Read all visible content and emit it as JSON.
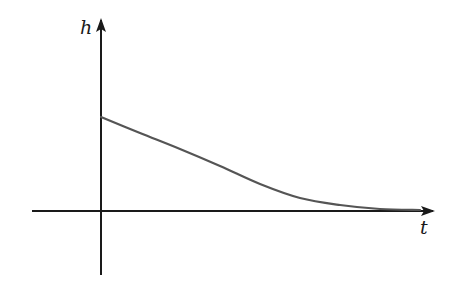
{
  "chart_data": {
    "type": "line",
    "title": "",
    "xlabel": "t",
    "ylabel": "h",
    "grid": false,
    "legend": null,
    "ticks": {
      "x": [],
      "y": []
    },
    "series": [
      {
        "name": "h(t)",
        "color": "#555555",
        "points_pixel": [
          [
            101,
            117
          ],
          [
            140,
            133
          ],
          [
            180,
            149
          ],
          [
            220,
            166
          ],
          [
            260,
            184
          ],
          [
            300,
            198
          ],
          [
            340,
            205
          ],
          [
            380,
            209
          ],
          [
            420,
            210
          ]
        ],
        "points_normalized": [
          [
            0.0,
            0.5
          ],
          [
            0.13,
            0.41
          ],
          [
            0.27,
            0.33
          ],
          [
            0.4,
            0.24
          ],
          [
            0.53,
            0.14
          ],
          [
            0.67,
            0.07
          ],
          [
            0.8,
            0.03
          ],
          [
            0.93,
            0.01
          ],
          [
            1.0,
            0.0
          ]
        ]
      }
    ],
    "axes": {
      "origin_px": [
        101,
        211
      ],
      "x_axis": {
        "from_px": 32,
        "to_px": 433,
        "arrow": true
      },
      "y_axis": {
        "from_px": 275,
        "to_px": 20,
        "arrow": true
      }
    }
  },
  "labels": {
    "h": "h",
    "t": "t"
  },
  "colors": {
    "axis": "#1a1a1a",
    "curve": "#555555",
    "background": "#ffffff"
  }
}
